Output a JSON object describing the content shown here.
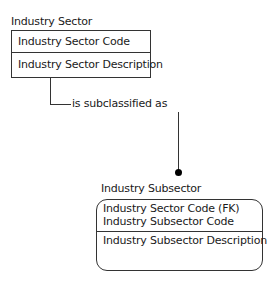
{
  "diagram": {
    "type": "entity-relationship (IDEF1X)",
    "entities": [
      {
        "name": "Industry Sector",
        "kind": "independent",
        "key_attributes": [
          "Industry Sector Code"
        ],
        "non_key_attributes": [
          "Industry Sector Description"
        ]
      },
      {
        "name": "Industry Subsector",
        "kind": "dependent",
        "key_attributes": [
          "Industry Sector Code (FK)",
          "Industry Subsector Code"
        ],
        "non_key_attributes": [
          "Industry Subsector Description"
        ]
      }
    ],
    "relationships": [
      {
        "from": "Industry Sector",
        "to": "Industry Subsector",
        "label": "is subclassified as",
        "cardinality": "one-to-many"
      }
    ]
  }
}
